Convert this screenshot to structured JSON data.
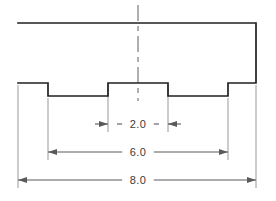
{
  "drawing": {
    "title": "stepped-block-profile",
    "type": "engineering-dimensioned-profile",
    "view": "front-elevation",
    "colors": {
      "background": "#ffffff",
      "outline": "#231f20",
      "dimension_line": "#5a5a5a",
      "extension_line": "#8c8c8c",
      "centerline": "#6e6e6e",
      "text": "#3b3b3b"
    },
    "part_outline": {
      "description": "Rectangular block with two rectangular notches cut into the bottom face, leaving a raised central boss and two end shoulders.",
      "points": [
        [
          18,
          23
        ],
        [
          256,
          23
        ],
        [
          256,
          83
        ],
        [
          228,
          83
        ],
        [
          228,
          96
        ],
        [
          168,
          96
        ],
        [
          168,
          83
        ],
        [
          108,
          83
        ],
        [
          108,
          96
        ],
        [
          48,
          96
        ],
        [
          48,
          83
        ],
        [
          18,
          83
        ]
      ],
      "stroke_width": 1.7
    },
    "centerline": {
      "name": "vertical-centerline",
      "x": 138,
      "y_top": 5,
      "y_bottom": 101,
      "dash_pattern": "16 5 5 5"
    },
    "extension_lines": [
      {
        "name": "ext-left-outer",
        "x": 18,
        "y_top": 85,
        "y_bottom": 188
      },
      {
        "name": "ext-left-notch",
        "x": 48,
        "y_top": 98,
        "y_bottom": 160
      },
      {
        "name": "ext-boss-left",
        "x": 108,
        "y_top": 85,
        "y_bottom": 132
      },
      {
        "name": "ext-boss-right",
        "x": 168,
        "y_top": 85,
        "y_bottom": 132
      },
      {
        "name": "ext-right-notch",
        "x": 228,
        "y_top": 98,
        "y_bottom": 160
      },
      {
        "name": "ext-right-outer",
        "x": 256,
        "y_top": 85,
        "y_bottom": 188
      }
    ],
    "dimensions": [
      {
        "id": "dim-2-0",
        "label": "2.0",
        "value": 2.0,
        "y": 124,
        "x_start": 108,
        "x_end": 168,
        "arrow_direction": "inward",
        "label_x": 138,
        "label_y": 128
      },
      {
        "id": "dim-6-0",
        "label": "6.0",
        "value": 6.0,
        "y": 152,
        "x_start": 48,
        "x_end": 228,
        "arrow_direction": "outward",
        "label_x": 138,
        "label_y": 156
      },
      {
        "id": "dim-8-0",
        "label": "8.0",
        "value": 8.0,
        "y": 180,
        "x_start": 18,
        "x_end": 256,
        "arrow_direction": "outward",
        "label_x": 138,
        "label_y": 184
      }
    ]
  }
}
